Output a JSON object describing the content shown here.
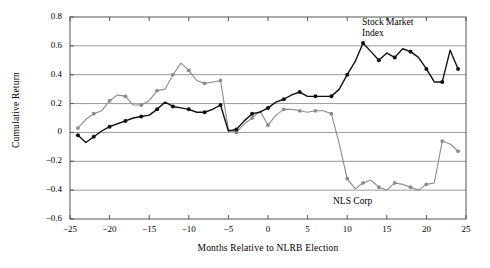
{
  "figure": {
    "clipped_header_text": "",
    "ylabel": "Cumulative Return",
    "xlabel": "Months Relative to NLRB Election",
    "annotation_stock": "Stock Market\nIndex",
    "annotation_stock_line1": "Stock Market",
    "annotation_stock_line2": "Index",
    "annotation_nls": "NLS Corp",
    "colors": {
      "stock_market_index": "#111111",
      "nls_corp": "#8c8c8c",
      "gridline": "#9a9a9a",
      "frame": "#555555",
      "background": "#ffffff"
    }
  },
  "chart_data": {
    "type": "line",
    "title": "",
    "xlabel": "Months Relative to NLRB Election",
    "ylabel": "Cumulative Return",
    "xlim": [
      -25,
      25
    ],
    "ylim": [
      -0.6,
      0.8
    ],
    "xticks": [
      -25,
      -20,
      -15,
      -10,
      -5,
      0,
      5,
      10,
      15,
      20,
      25
    ],
    "xticklabels": [
      "−25",
      "−20",
      "−15",
      "−10",
      "−5",
      "0",
      "5",
      "10",
      "15",
      "20",
      "25"
    ],
    "yticks": [
      -0.6,
      -0.4,
      -0.2,
      0,
      0.2,
      0.4,
      0.6,
      0.8
    ],
    "yticklabels": [
      "−0.6",
      "−0.4",
      "−0.2",
      "0",
      "0.2",
      "0.4",
      "0.6",
      "0.8"
    ],
    "grid": "horizontal",
    "legend": "inline-annotations",
    "markers": "filled-circles",
    "series": [
      {
        "name": "NLS Corp",
        "color": "#8c8c8c",
        "x": [
          -24,
          -23,
          -22,
          -21,
          -20,
          -19,
          -18,
          -17,
          -16,
          -15,
          -14,
          -13,
          -12,
          -11,
          -10,
          -9,
          -8,
          -7,
          -6,
          -5,
          -4,
          -3,
          -2,
          -1,
          0,
          1,
          2,
          3,
          4,
          5,
          6,
          7,
          8,
          9,
          10,
          11,
          12,
          13,
          14,
          15,
          16,
          17,
          18,
          19,
          20,
          21,
          22,
          23,
          24
        ],
        "values": [
          0.03,
          0.09,
          0.13,
          0.15,
          0.22,
          0.26,
          0.25,
          0.19,
          0.19,
          0.22,
          0.29,
          0.3,
          0.4,
          0.48,
          0.43,
          0.36,
          0.34,
          0.35,
          0.36,
          0.02,
          0.0,
          0.06,
          0.1,
          0.15,
          0.05,
          0.12,
          0.16,
          0.16,
          0.15,
          0.14,
          0.15,
          0.15,
          0.13,
          -0.08,
          -0.32,
          -0.39,
          -0.35,
          -0.33,
          -0.38,
          -0.4,
          -0.35,
          -0.36,
          -0.38,
          -0.4,
          -0.36,
          -0.35,
          -0.06,
          -0.08,
          -0.13
        ]
      },
      {
        "name": "Stock Market Index",
        "color": "#111111",
        "x": [
          -24,
          -23,
          -22,
          -21,
          -20,
          -19,
          -18,
          -17,
          -16,
          -15,
          -14,
          -13,
          -12,
          -11,
          -10,
          -9,
          -8,
          -7,
          -6,
          -5,
          -4,
          -3,
          -2,
          -1,
          0,
          1,
          2,
          3,
          4,
          5,
          6,
          7,
          8,
          9,
          10,
          11,
          12,
          13,
          14,
          15,
          16,
          17,
          18,
          19,
          20,
          21,
          22,
          23,
          24
        ],
        "values": [
          -0.02,
          -0.07,
          -0.03,
          0.01,
          0.04,
          0.06,
          0.08,
          0.1,
          0.11,
          0.12,
          0.16,
          0.21,
          0.18,
          0.17,
          0.16,
          0.14,
          0.14,
          0.16,
          0.19,
          0.01,
          0.02,
          0.08,
          0.13,
          0.14,
          0.17,
          0.21,
          0.23,
          0.26,
          0.28,
          0.25,
          0.25,
          0.25,
          0.25,
          0.3,
          0.4,
          0.49,
          0.62,
          0.56,
          0.5,
          0.55,
          0.52,
          0.58,
          0.56,
          0.52,
          0.44,
          0.35,
          0.35,
          0.57,
          0.44
        ]
      }
    ]
  }
}
